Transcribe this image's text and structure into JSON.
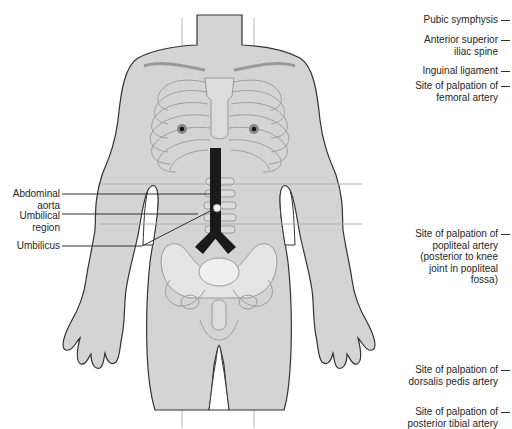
{
  "diagram": {
    "colors": {
      "body_fill": "#d4d4d4",
      "outline": "#333333",
      "skeleton_line": "#9a9a9a",
      "guide_line": "#b0b0b0",
      "aorta": "#1a1a1a",
      "pelvis_fill": "#e4e4e4"
    }
  },
  "left_labels": [
    {
      "id": "abdominal-aorta",
      "text_line1": "Abdominal",
      "text_line2": "aorta"
    },
    {
      "id": "umbilical-region",
      "text_line1": "Umbilical",
      "text_line2": "region"
    },
    {
      "id": "umbilicus",
      "text_line1": "Umbilicus",
      "text_line2": ""
    }
  ],
  "right_labels": [
    {
      "id": "pubic-symphysis",
      "lines": [
        "Pubic symphysis"
      ]
    },
    {
      "id": "anterior-superior-iliac-spine",
      "lines": [
        "Anterior superior",
        "iliac spine"
      ]
    },
    {
      "id": "inguinal-ligament",
      "lines": [
        "Inguinal ligament"
      ]
    },
    {
      "id": "femoral-artery",
      "lines": [
        "Site of palpation of",
        "femoral artery"
      ]
    },
    {
      "id": "popliteal-artery",
      "lines": [
        "Site of palpation of",
        "popliteal artery",
        "(posterior to knee",
        "joint in popliteal",
        "fossa)"
      ]
    },
    {
      "id": "dorsalis-pedis-artery",
      "lines": [
        "Site of palpation of",
        "dorsalis pedis artery"
      ]
    },
    {
      "id": "posterior-tibial-artery",
      "lines": [
        "Site of palpation of",
        "posterior tibial artery"
      ]
    }
  ]
}
